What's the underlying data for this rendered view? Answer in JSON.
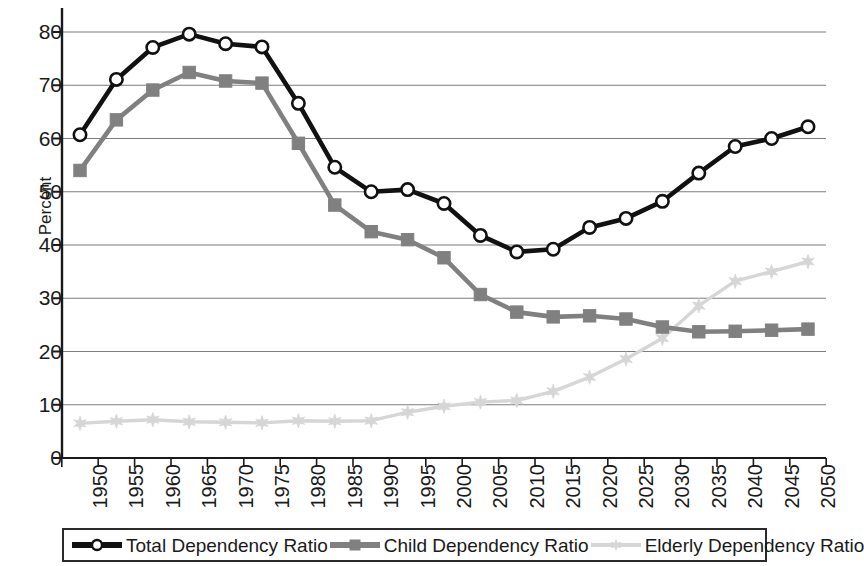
{
  "chart_data": {
    "type": "line",
    "title": "",
    "subtitle": "",
    "xlabel": "",
    "ylabel": "Percent",
    "ylim": [
      0,
      80
    ],
    "ytick_step": 10,
    "yticks": [
      0,
      10,
      20,
      30,
      40,
      50,
      60,
      70,
      80
    ],
    "grid": true,
    "grid_axis": "y",
    "legend_position": "bottom",
    "categories": [
      "1950",
      "1955",
      "1960",
      "1965",
      "1970",
      "1975",
      "1980",
      "1985",
      "1990",
      "1995",
      "2000",
      "2005",
      "2010",
      "2015",
      "2020",
      "2025",
      "2030",
      "2035",
      "2040",
      "2045",
      "2050"
    ],
    "series": [
      {
        "name": "Total Dependency Ratio",
        "color": "#111111",
        "marker": "circle-open",
        "values": [
          60.7,
          71.1,
          77.1,
          79.6,
          77.8,
          77.2,
          66.6,
          54.6,
          50.0,
          50.4,
          47.8,
          41.8,
          38.7,
          39.2,
          43.3,
          45.0,
          48.2,
          53.5,
          58.5,
          60.0,
          62.2
        ]
      },
      {
        "name": "Child Dependency Ratio",
        "color": "#808080",
        "marker": "square",
        "values": [
          54.0,
          63.5,
          69.1,
          72.4,
          70.8,
          70.4,
          59.1,
          47.5,
          42.5,
          41.0,
          37.6,
          30.7,
          27.4,
          26.5,
          26.7,
          26.1,
          24.6,
          23.7,
          23.8,
          24.0,
          24.2
        ]
      },
      {
        "name": "Elderly Dependency Ratio",
        "color": "#d6d6d6",
        "marker": "star",
        "values": [
          6.5,
          6.9,
          7.2,
          6.8,
          6.7,
          6.6,
          7.0,
          6.9,
          7.0,
          8.6,
          9.7,
          10.5,
          10.8,
          12.5,
          15.2,
          18.6,
          22.5,
          28.6,
          33.2,
          35.0,
          36.9
        ]
      }
    ]
  },
  "legend": {
    "entries": [
      {
        "label": "Total Dependency Ratio"
      },
      {
        "label": "Child Dependency Ratio"
      },
      {
        "label": "Elderly Dependency Ratio"
      }
    ]
  }
}
